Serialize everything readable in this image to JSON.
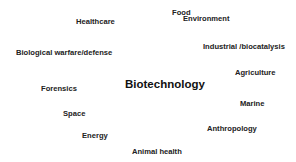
{
  "diagram": {
    "center": "Biotechnology",
    "terms": [
      {
        "label": "Food"
      },
      {
        "label": "Healthcare"
      },
      {
        "label": "Environment"
      },
      {
        "label": "Biological warfare/defense"
      },
      {
        "label": "Industrial /biocatalysis"
      },
      {
        "label": "Agriculture"
      },
      {
        "label": "Forensics"
      },
      {
        "label": "Marine"
      },
      {
        "label": "Space"
      },
      {
        "label": "Anthropology"
      },
      {
        "label": "Energy"
      },
      {
        "label": "Animal health"
      }
    ]
  }
}
